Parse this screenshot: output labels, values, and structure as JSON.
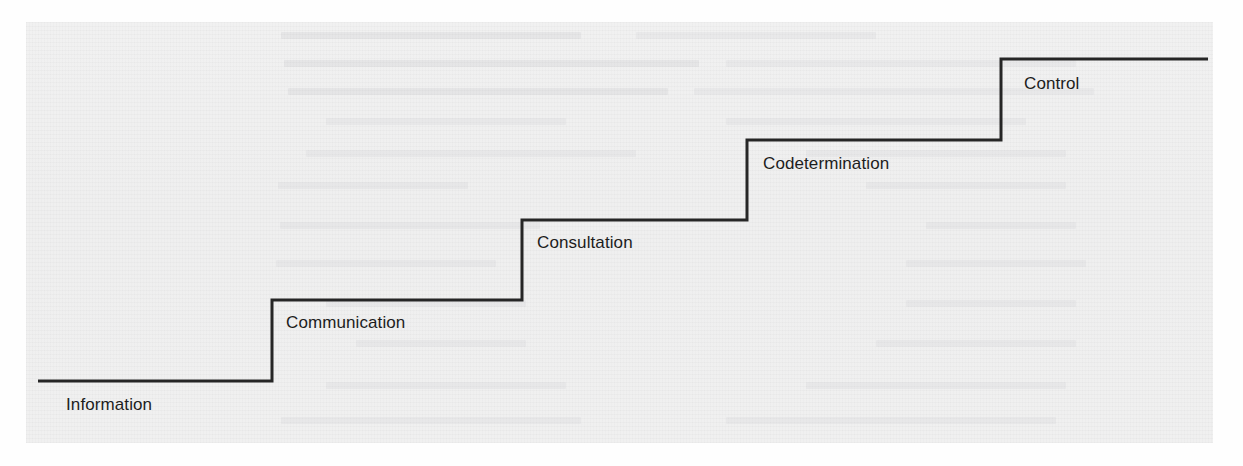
{
  "figure": {
    "type": "diagram",
    "diagram_kind": "staircase-ladder",
    "line_color": "#262626",
    "line_width_px": 3,
    "panel_color": "#f0f0f0",
    "page_color": "#fefefe",
    "label_color": "#1d1d1d",
    "panel": {
      "x": 26,
      "y": 22,
      "width": 1187,
      "height": 421
    },
    "steps": [
      {
        "index": 1,
        "label": "Information",
        "tread": {
          "x1": 38,
          "x2": 272,
          "y": 381
        },
        "riser": {
          "x": 272,
          "y1": 381,
          "y2": 300
        },
        "label_pos": {
          "x": 66,
          "y": 398
        }
      },
      {
        "index": 2,
        "label": "Communication",
        "tread": {
          "x1": 272,
          "x2": 522,
          "y": 300
        },
        "riser": {
          "x": 522,
          "y1": 300,
          "y2": 220
        },
        "label_pos": {
          "x": 286,
          "y": 316
        }
      },
      {
        "index": 3,
        "label": "Consultation",
        "tread": {
          "x1": 522,
          "x2": 747,
          "y": 220
        },
        "riser": {
          "x": 747,
          "y1": 220,
          "y2": 140
        },
        "label_pos": {
          "x": 537,
          "y": 236
        }
      },
      {
        "index": 4,
        "label": "Codetermination",
        "tread": {
          "x1": 747,
          "x2": 1001,
          "y": 140
        },
        "riser": {
          "x": 1001,
          "y1": 140,
          "y2": 59
        },
        "label_pos": {
          "x": 763,
          "y": 157
        }
      },
      {
        "index": 5,
        "label": "Control",
        "tread": {
          "x1": 1001,
          "x2": 1208,
          "y": 59
        },
        "riser": null,
        "label_pos": {
          "x": 1024,
          "y": 77
        }
      }
    ]
  },
  "chart_data": {
    "type": "bar",
    "title": "",
    "xlabel": "",
    "ylabel": "",
    "categories": [
      "Information",
      "Communication",
      "Consultation",
      "Codetermination",
      "Control"
    ],
    "values": [
      1,
      2,
      3,
      4,
      5
    ],
    "ylim": [
      0,
      5
    ],
    "grid": false,
    "legend": null,
    "annotations": [
      "Information",
      "Communication",
      "Consultation",
      "Codetermination",
      "Control"
    ]
  }
}
